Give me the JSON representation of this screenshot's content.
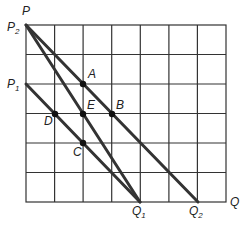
{
  "diagram": {
    "grid": {
      "columns": 7,
      "rows": 6,
      "left": 26,
      "top": 25,
      "right": 226,
      "bottom": 202,
      "line_color": "#333333"
    },
    "line_color": "#333333",
    "axes": {
      "y_label": "P",
      "x_label": "Q"
    },
    "intercepts": {
      "P2": {
        "label": "P",
        "sub": "2",
        "x": 26,
        "y": 25
      },
      "P1": {
        "label": "P",
        "sub": "1",
        "x": 26,
        "y": 84
      },
      "Q1": {
        "label": "Q",
        "sub": "1",
        "x": 140,
        "y": 202
      },
      "Q2": {
        "label": "Q",
        "sub": "2",
        "x": 198,
        "y": 202
      }
    },
    "lines": [
      {
        "name": "P2-Q2",
        "from": [
          26,
          25
        ],
        "to": [
          198,
          202
        ]
      },
      {
        "name": "P2-Q1",
        "from": [
          26,
          25
        ],
        "to": [
          140,
          202
        ]
      },
      {
        "name": "P1-Q1",
        "from": [
          26,
          84
        ],
        "to": [
          140,
          202
        ]
      }
    ],
    "points": [
      {
        "label": "A",
        "x": 83,
        "y": 84
      },
      {
        "label": "B",
        "x": 112,
        "y": 114
      },
      {
        "label": "C",
        "x": 83,
        "y": 143
      },
      {
        "label": "D",
        "x": 55,
        "y": 114
      },
      {
        "label": "E",
        "x": 83,
        "y": 114
      }
    ]
  }
}
